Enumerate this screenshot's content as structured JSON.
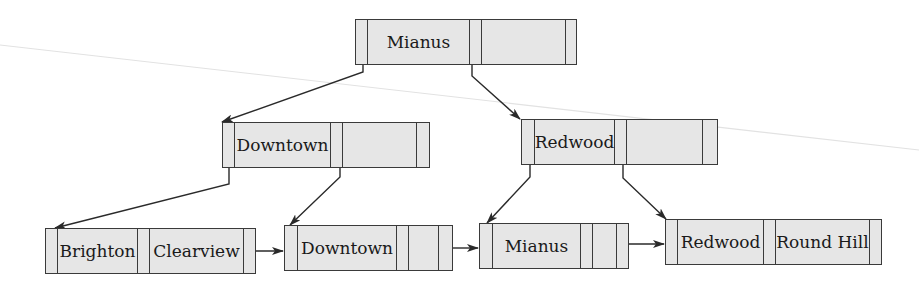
{
  "diagram": {
    "type": "B+ tree",
    "colors": {
      "node_fill": "#e6e6e6",
      "border": "#3a3a3a",
      "arrow": "#2a2a2a",
      "artifact_line": "#e2e2e2"
    },
    "root": {
      "x": 355,
      "y": 19,
      "w": 222,
      "cells": [
        {
          "kind": "ptr",
          "w": 12
        },
        {
          "kind": "key",
          "w": 102,
          "label": "Mianus"
        },
        {
          "kind": "ptr",
          "w": 12
        },
        {
          "kind": "key",
          "w": 84,
          "label": ""
        },
        {
          "kind": "ptr",
          "w": 12
        }
      ]
    },
    "internal": [
      {
        "id": "downtown-internal",
        "x": 222,
        "y": 122,
        "w": 208,
        "cells": [
          {
            "kind": "ptr",
            "w": 12
          },
          {
            "kind": "key",
            "w": 96,
            "label": "Downtown"
          },
          {
            "kind": "ptr",
            "w": 12
          },
          {
            "kind": "key",
            "w": 74,
            "label": ""
          },
          {
            "kind": "ptr",
            "w": 12
          }
        ]
      },
      {
        "id": "redwood-internal",
        "x": 521,
        "y": 119,
        "w": 197,
        "cells": [
          {
            "kind": "ptr",
            "w": 13
          },
          {
            "kind": "key",
            "w": 80,
            "label": "Redwood"
          },
          {
            "kind": "ptr",
            "w": 12
          },
          {
            "kind": "key",
            "w": 76,
            "label": ""
          },
          {
            "kind": "ptr",
            "w": 12
          }
        ]
      }
    ],
    "leaves": [
      {
        "id": "leaf-1",
        "x": 45,
        "y": 228,
        "w": 211,
        "cells": [
          {
            "kind": "ptr",
            "w": 12
          },
          {
            "kind": "key",
            "w": 80,
            "label": "Brighton"
          },
          {
            "kind": "ptr",
            "w": 12
          },
          {
            "kind": "key",
            "w": 94,
            "label": "Clearview"
          },
          {
            "kind": "ptr",
            "w": 12
          }
        ]
      },
      {
        "id": "leaf-2",
        "x": 284,
        "y": 225,
        "w": 169,
        "cells": [
          {
            "kind": "ptr",
            "w": 13
          },
          {
            "kind": "key",
            "w": 99,
            "label": "Downtown"
          },
          {
            "kind": "ptr",
            "w": 12
          },
          {
            "kind": "key",
            "w": 30,
            "label": ""
          },
          {
            "kind": "ptr",
            "w": 13
          }
        ]
      },
      {
        "id": "leaf-3",
        "x": 479,
        "y": 223,
        "w": 150,
        "cells": [
          {
            "kind": "ptr",
            "w": 13
          },
          {
            "kind": "key",
            "w": 88,
            "label": "Mianus"
          },
          {
            "kind": "ptr",
            "w": 12
          },
          {
            "kind": "key",
            "w": 24,
            "label": ""
          },
          {
            "kind": "ptr",
            "w": 12
          }
        ]
      },
      {
        "id": "leaf-4",
        "x": 665,
        "y": 219,
        "w": 217,
        "cells": [
          {
            "kind": "ptr",
            "w": 12
          },
          {
            "kind": "key",
            "w": 86,
            "label": "Redwood"
          },
          {
            "kind": "ptr",
            "w": 12
          },
          {
            "kind": "key",
            "w": 94,
            "label": "Round Hill"
          },
          {
            "kind": "ptr",
            "w": 13
          }
        ]
      }
    ],
    "edges": [
      {
        "from": "root.p0",
        "points": [
          [
            363,
            65
          ],
          [
            363,
            72
          ],
          [
            222,
            122
          ]
        ]
      },
      {
        "from": "root.p1",
        "points": [
          [
            472,
            65
          ],
          [
            472,
            76
          ],
          [
            520,
            119
          ]
        ]
      },
      {
        "from": "downtown.p0",
        "points": [
          [
            229,
            168
          ],
          [
            229,
            184
          ],
          [
            55,
            228
          ]
        ]
      },
      {
        "from": "downtown.p1",
        "points": [
          [
            340,
            168
          ],
          [
            340,
            177
          ],
          [
            290,
            225
          ]
        ]
      },
      {
        "from": "redwood.p0",
        "points": [
          [
            530,
            165
          ],
          [
            530,
            177
          ],
          [
            487,
            223
          ]
        ]
      },
      {
        "from": "redwood.p1",
        "points": [
          [
            623,
            165
          ],
          [
            623,
            178
          ],
          [
            666,
            219
          ]
        ]
      }
    ],
    "sibling_links": [
      {
        "points": [
          [
            250,
            251
          ],
          [
            283,
            251
          ]
        ]
      },
      {
        "points": [
          [
            446,
            248
          ],
          [
            478,
            248
          ]
        ]
      },
      {
        "points": [
          [
            623,
            244
          ],
          [
            664,
            244
          ]
        ]
      }
    ],
    "artifact_line": {
      "points": [
        [
          0,
          45
        ],
        [
          919,
          150
        ]
      ]
    }
  }
}
